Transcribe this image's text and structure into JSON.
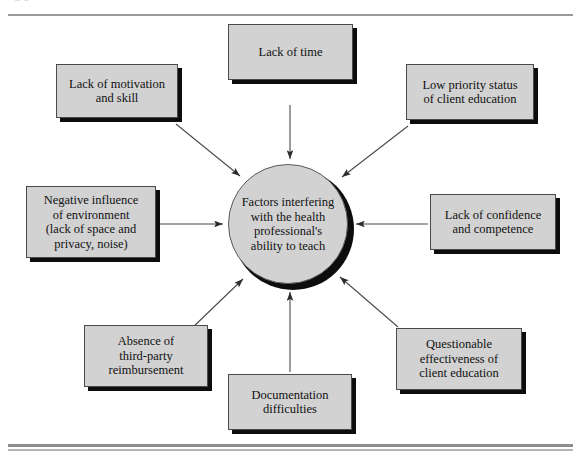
{
  "figure": {
    "caption_sliver": "g                                                                g",
    "center": {
      "text": "Factors interfering\nwith the health\nprofessional's\nability to teach"
    },
    "nodes": [
      {
        "id": "lack-of-time",
        "text": "Lack of time"
      },
      {
        "id": "lack-of-motivation",
        "text": "Lack of motivation\nand skill"
      },
      {
        "id": "low-priority-status",
        "text": "Low priority status\nof client education"
      },
      {
        "id": "negative-influence",
        "text": "Negative influence\nof environment\n(lack of space and\nprivacy, noise)"
      },
      {
        "id": "lack-of-confidence",
        "text": "Lack of confidence\nand competence"
      },
      {
        "id": "absence-reimbursement",
        "text": "Absence of\nthird-party\nreimbursement"
      },
      {
        "id": "documentation",
        "text": "Documentation\ndifficulties"
      },
      {
        "id": "questionable-effectiveness",
        "text": "Questionable\neffectiveness of\nclient education"
      }
    ],
    "colors": {
      "box_fill": "#d2d2d2",
      "box_border": "#4a4a4a",
      "shadow": "#0d0d0d",
      "arrow": "#3a3a3a",
      "rule": "#9a9a9a",
      "text": "#111111"
    }
  }
}
